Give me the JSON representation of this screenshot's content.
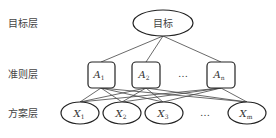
{
  "layers": {
    "goal_label": "目标层",
    "criteria_label": "准则层",
    "alternatives_label": "方案层"
  },
  "goal": {
    "label": "目标"
  },
  "criteria": [
    {
      "label": "A",
      "sub": "1"
    },
    {
      "label": "A",
      "sub": "2"
    },
    {
      "label": "A",
      "sub": "n"
    }
  ],
  "criteria_ellipsis": "…",
  "alternatives": [
    {
      "label": "X",
      "sub": "1"
    },
    {
      "label": "X",
      "sub": "2"
    },
    {
      "label": "X",
      "sub": "3"
    },
    {
      "label": "X",
      "sub": "m"
    }
  ],
  "alternatives_ellipsis": "…"
}
